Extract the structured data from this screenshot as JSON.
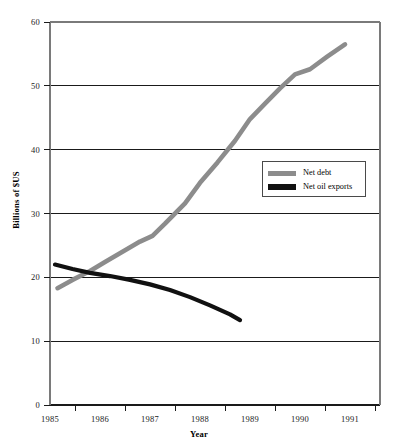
{
  "chart_data": {
    "type": "line",
    "title": "",
    "xlabel": "Year",
    "ylabel": "Billions of $US",
    "xlim": [
      1985,
      1991.6
    ],
    "ylim": [
      0,
      60
    ],
    "yticks": [
      0,
      10,
      20,
      30,
      40,
      50,
      60
    ],
    "ytick_labels": [
      "0",
      "10",
      "20",
      "30",
      "40",
      "50",
      "60"
    ],
    "xticks": [
      1985,
      1986,
      1987,
      1988,
      1989,
      1990,
      1991
    ],
    "xtick_labels": [
      "1985",
      "1986",
      "1987",
      "1988",
      "1989",
      "1990",
      "1991"
    ],
    "grid": "horizontal",
    "legend_position": "center-right",
    "series": [
      {
        "name": "Net debt",
        "color": "#8c8c8c",
        "x": [
          1985.15,
          1985.45,
          1985.8,
          1986.1,
          1986.45,
          1986.8,
          1987.05,
          1987.3,
          1987.7,
          1988.0,
          1988.35,
          1988.7,
          1989.0,
          1989.3,
          1989.6,
          1989.9,
          1990.2,
          1990.55,
          1990.9
        ],
        "y": [
          18.3,
          19.6,
          21.0,
          22.4,
          24.0,
          25.6,
          26.5,
          28.4,
          31.6,
          34.8,
          38.0,
          41.4,
          44.8,
          47.2,
          49.6,
          51.8,
          52.6,
          54.6,
          56.5
        ]
      },
      {
        "name": "Net oil exports",
        "color": "#111111",
        "x": [
          1985.1,
          1985.45,
          1985.8,
          1986.2,
          1986.6,
          1987.0,
          1987.4,
          1987.8,
          1988.2,
          1988.6,
          1988.8
        ],
        "y": [
          22.0,
          21.3,
          20.7,
          20.2,
          19.6,
          18.9,
          18.0,
          16.9,
          15.6,
          14.2,
          13.3
        ]
      }
    ]
  },
  "axes": {
    "y_title": "Billions of $US",
    "x_title": "Year"
  },
  "legend": {
    "entries": [
      {
        "label": "Net debt",
        "color": "#8c8c8c"
      },
      {
        "label": "Net oil exports",
        "color": "#111111"
      }
    ]
  },
  "colors": {
    "net_debt": "#8c8c8c",
    "net_oil_exports": "#111111",
    "gridline": "#1a1a1a",
    "frame": "#7a7a7a",
    "background": "#ffffff"
  }
}
